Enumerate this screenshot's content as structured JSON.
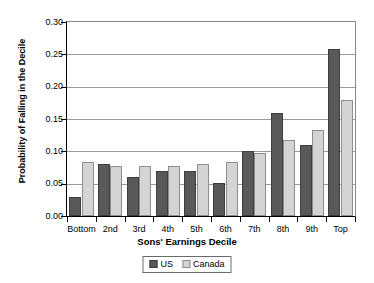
{
  "chart_data": {
    "type": "bar",
    "title": "",
    "xlabel": "Sons' Earnings Decile",
    "ylabel": "Probability of Falling in the Decile",
    "categories": [
      "Bottom",
      "2nd",
      "3rd",
      "4th",
      "5th",
      "6th",
      "7th",
      "8th",
      "9th",
      "Top"
    ],
    "series": [
      {
        "name": "US",
        "color": "#595959",
        "values": [
          0.03,
          0.08,
          0.061,
          0.07,
          0.07,
          0.051,
          0.1,
          0.16,
          0.11,
          0.258
        ]
      },
      {
        "name": "Canada",
        "color": "#d4d4d4",
        "values": [
          0.084,
          0.078,
          0.077,
          0.077,
          0.08,
          0.084,
          0.097,
          0.118,
          0.133,
          0.18
        ]
      }
    ],
    "ylim": [
      0.0,
      0.3
    ],
    "yticks": [
      "0.00",
      "0.05",
      "0.10",
      "0.15",
      "0.20",
      "0.25",
      "0.30"
    ],
    "ytick_values": [
      0.0,
      0.05,
      0.1,
      0.15,
      0.2,
      0.25,
      0.3
    ],
    "grid": true,
    "legend_position": "bottom-center"
  },
  "legend": {
    "entries": [
      {
        "label": "US",
        "swatch": "us-swatch"
      },
      {
        "label": "Canada",
        "swatch": "canada-swatch"
      }
    ]
  }
}
